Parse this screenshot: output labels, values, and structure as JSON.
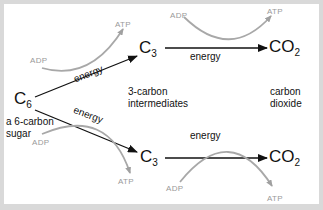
{
  "diagram": {
    "nodes": {
      "c6": {
        "label": "C",
        "sub": "6",
        "caption_line1": "a 6-carbon",
        "caption_line2": "sugar"
      },
      "c3_top": {
        "label": "C",
        "sub": "3"
      },
      "c3_bottom": {
        "label": "C",
        "sub": "3"
      },
      "co2_top": {
        "label": "CO",
        "sub": "2"
      },
      "co2_bottom": {
        "label": "CO",
        "sub": "2"
      }
    },
    "edge_labels": {
      "c6_to_c3_top": "energy",
      "c6_to_c3_bottom": "energy",
      "c3_to_co2_top": "energy",
      "c3_to_co2_bottom": "energy"
    },
    "cofactors": {
      "top_left": {
        "from": "ADP",
        "to": "ATP"
      },
      "top_right": {
        "from": "ADP",
        "to": "ATP"
      },
      "bottom_left": {
        "from": "ADP",
        "to": "ATP"
      },
      "bottom_right": {
        "from": "ADP",
        "to": "ATP"
      }
    },
    "captions": {
      "intermediates_line1": "3-carbon",
      "intermediates_line2": "intermediates",
      "dioxide_line1": "carbon",
      "dioxide_line2": "dioxide"
    },
    "colors": {
      "arrow": "#111111",
      "cofactor": "#a0a0a0",
      "background": "#ffffff",
      "frame": "#d9d9d9"
    }
  }
}
